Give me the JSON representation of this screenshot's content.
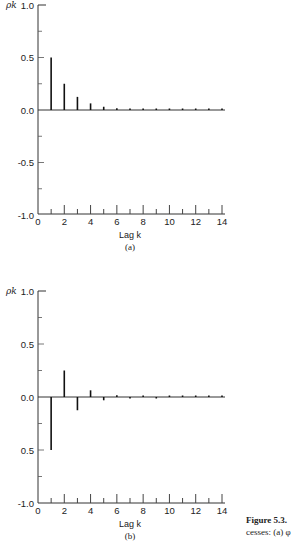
{
  "chart_data": [
    {
      "type": "bar",
      "subtype": "stem",
      "panel_label": "(a)",
      "ylabel": "ρk",
      "xlabel": "Lag k",
      "ylim": [
        -1.0,
        1.0
      ],
      "xlim": [
        0,
        14
      ],
      "yticks": [
        "1.0",
        "0.5",
        "0.0",
        "-0.5",
        "-1.0"
      ],
      "xticks": [
        "0",
        "2",
        "4",
        "6",
        "8",
        "10",
        "12",
        "14"
      ],
      "x": [
        1,
        2,
        3,
        4,
        5,
        6,
        7,
        8,
        9,
        10,
        11,
        12,
        13,
        14
      ],
      "values": [
        0.5,
        0.25,
        0.125,
        0.063,
        0.031,
        0.016,
        0.008,
        0.004,
        0.002,
        0.001,
        0.0,
        0.0,
        0.0,
        0.0
      ],
      "grid": false
    },
    {
      "type": "bar",
      "subtype": "stem",
      "panel_label": "(b)",
      "ylabel": "ρk",
      "xlabel": "Lag k",
      "ylim": [
        -1.0,
        1.0
      ],
      "xlim": [
        0,
        14
      ],
      "yticks": [
        "1.0",
        "0.5",
        "0.0",
        "0.5",
        "-1.0"
      ],
      "xticks": [
        "0",
        "2",
        "4",
        "6",
        "8",
        "10",
        "12",
        "14"
      ],
      "x": [
        1,
        2,
        3,
        4,
        5,
        6,
        7,
        8,
        9,
        10,
        11,
        12,
        13,
        14
      ],
      "values": [
        -0.5,
        0.25,
        -0.125,
        0.063,
        -0.031,
        0.016,
        -0.008,
        0.004,
        -0.002,
        0.001,
        0.0,
        0.0,
        0.0,
        0.0
      ],
      "grid": false
    }
  ],
  "caption": {
    "line1": "Figure 5.3.",
    "line2": "cesses: (a) φ"
  }
}
